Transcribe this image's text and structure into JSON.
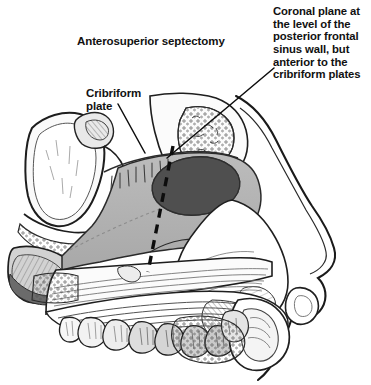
{
  "figure": {
    "width": 371,
    "height": 385,
    "background_color": "#ffffff"
  },
  "labels": {
    "septectomy": "Anterosuperior septectomy",
    "cribriform_plate": "Cribriform\nplate",
    "coronal_plane": "Coronal plane at\nthe level of the\nposterior frontal\nsinus wall, but\nanterior to the\ncribriform plates"
  },
  "colors": {
    "ink": "#111111",
    "outline": "#1a1a1a",
    "septectomy_fill": "#4f4f4f",
    "mucosa_gray": "#b4b4b4",
    "bone_light": "#f2f2f2",
    "shade_mid": "#cfcfcf",
    "shade_dark": "#8a8a8a",
    "background": "#ffffff"
  },
  "annotations": {
    "cribriform_leader": {
      "name": "cribriform-leader-line",
      "from_x": 118,
      "from_y": 104,
      "to_x": 144,
      "to_y": 152
    },
    "coronal_leader": {
      "name": "coronal-leader-line",
      "from_x": 272,
      "from_y": 70,
      "to_x": 168,
      "to_y": 157
    },
    "coronal_plane_dashes": {
      "name": "coronal-plane-dashed-line",
      "top_x": 173,
      "top_y": 146,
      "bottom_x": 148,
      "bottom_y": 272,
      "dash_pattern": "9 7",
      "stroke_width": 3.2
    }
  },
  "structures": [
    {
      "name": "sphenoid-sinus",
      "label_shown": false
    },
    {
      "name": "cribriform-plate",
      "label_shown": true
    },
    {
      "name": "nasal-septum-mucosa",
      "label_shown": false
    },
    {
      "name": "septectomy-window",
      "label_shown": false
    },
    {
      "name": "frontal-sinus",
      "label_shown": false
    },
    {
      "name": "nasal-dorsum",
      "label_shown": false
    },
    {
      "name": "hard-palate",
      "label_shown": false
    },
    {
      "name": "maxillary-teeth",
      "label_shown": false
    },
    {
      "name": "upper-lip",
      "label_shown": false
    },
    {
      "name": "clivus",
      "label_shown": false
    }
  ]
}
